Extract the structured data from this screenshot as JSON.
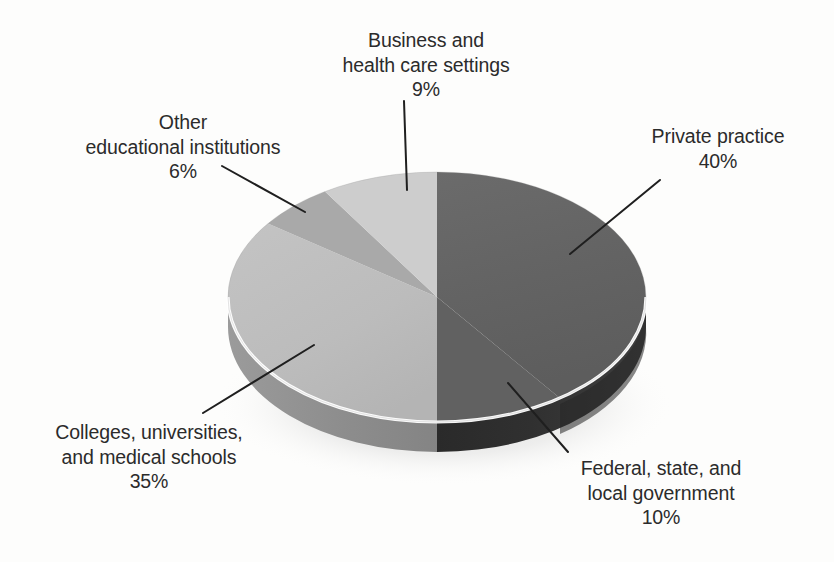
{
  "chart_data": {
    "type": "pie",
    "title": "",
    "subtitle": "",
    "xlabel": "",
    "ylabel": "",
    "legend_position": "none",
    "grid": false,
    "three_d": true,
    "start_angle_deg": 0,
    "direction": "clockwise",
    "unit": "%",
    "categories": [
      "Private practice",
      "Federal, state, and local government",
      "Colleges, universities, and medical schools",
      "Other educational institutions",
      "Business and health care settings"
    ],
    "values": [
      40,
      10,
      35,
      6,
      9
    ],
    "slices": [
      {
        "id": "private-practice",
        "label": "Private practice",
        "label_lines": [
          "Private practice",
          "40%"
        ],
        "value": 40,
        "value_text": "40%",
        "color": "#646464",
        "side_color": "#3c3c3c"
      },
      {
        "id": "federal-state-local-government",
        "label": "Federal, state, and local government",
        "label_lines": [
          "Federal, state, and",
          "local government",
          "10%"
        ],
        "value": 10,
        "value_text": "10%",
        "color": "#646464",
        "side_color": "#2e2e2e"
      },
      {
        "id": "colleges-universities-medical-schools",
        "label": "Colleges, universities, and medical schools",
        "label_lines": [
          "Colleges, universities,",
          "and medical schools",
          "35%"
        ],
        "value": 35,
        "value_text": "35%",
        "color": "#bdbdbd",
        "side_color": "#8f8f8f"
      },
      {
        "id": "other-educational-institutions",
        "label": "Other educational institutions",
        "label_lines": [
          "Other",
          "educational institutions",
          "6%"
        ],
        "value": 6,
        "value_text": "6%",
        "color": "#a9a9a9",
        "side_color": "#8a8a8a"
      },
      {
        "id": "business-and-health-care-settings",
        "label": "Business and health care settings",
        "label_lines": [
          "Business and",
          "health care settings",
          "9%"
        ],
        "value": 9,
        "value_text": "9%",
        "color": "#cdcdcd",
        "side_color": "#9a9a9a"
      }
    ]
  },
  "labels": {
    "business": {
      "line1": "Business and",
      "line2": "health care settings",
      "line3": "9%"
    },
    "other_educational": {
      "line1": "Other",
      "line2": "educational institutions",
      "line3": "6%"
    },
    "private_practice": {
      "line1": "Private practice",
      "line2": "40%"
    },
    "colleges": {
      "line1": "Colleges, universities,",
      "line2": "and medical schools",
      "line3": "35%"
    },
    "federal": {
      "line1": "Federal, state, and",
      "line2": "local government",
      "line3": "10%"
    }
  },
  "colors": {
    "background": "#fdfdfc",
    "text": "#2b2b2b",
    "leader_line": "#1f1f1f",
    "rim_highlight": "#ffffff",
    "slice_private": "#646464",
    "slice_federal": "#646464",
    "slice_colleges": "#bdbdbd",
    "slice_other_edu": "#a9a9a9",
    "slice_business": "#cdcdcd"
  }
}
